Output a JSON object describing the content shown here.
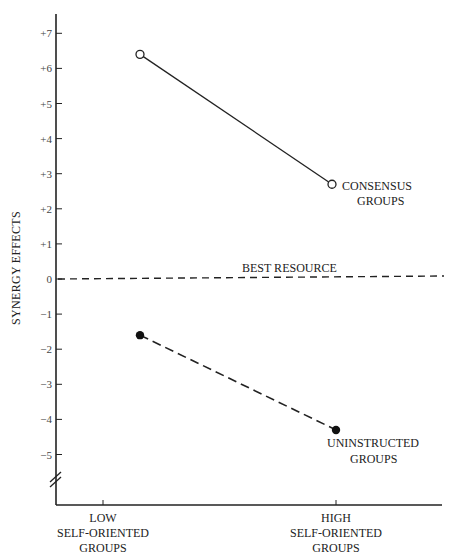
{
  "chart_data": {
    "type": "line",
    "title": "",
    "xlabel": "",
    "ylabel": "SYNERGY EFFECTS",
    "categories": [
      "LOW SELF-ORIENTED GROUPS",
      "HIGH SELF-ORIENTED GROUPS"
    ],
    "category_lines": [
      [
        "LOW",
        "SELF-ORIENTED",
        "GROUPS"
      ],
      [
        "HIGH",
        "SELF-ORIENTED",
        "GROUPS"
      ]
    ],
    "y_ticks": [
      "+7",
      "+6",
      "+5",
      "+4",
      "+3",
      "+2",
      "+1",
      "0",
      "-1",
      "-2",
      "-3",
      "-4",
      "-5"
    ],
    "ylim": [
      -6,
      7.5
    ],
    "grid": false,
    "axis_break": true,
    "series": [
      {
        "name": "CONSENSUS GROUPS",
        "label_lines": [
          "CONSENSUS",
          "GROUPS"
        ],
        "values": [
          6.4,
          2.7
        ],
        "line_style": "solid",
        "marker": "open-circle",
        "color": "#222222"
      },
      {
        "name": "UNINSTRUCTED GROUPS",
        "label_lines": [
          "UNINSTRUCTED",
          "GROUPS"
        ],
        "values": [
          -1.6,
          -4.3
        ],
        "line_style": "dashed",
        "marker": "filled-circle",
        "color": "#222222"
      }
    ],
    "reference_lines": [
      {
        "name": "BEST RESOURCE",
        "y": 0,
        "line_style": "dashed"
      }
    ]
  }
}
